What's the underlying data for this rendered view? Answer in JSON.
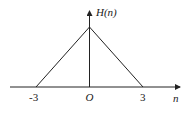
{
  "diagram": {
    "type": "triangular-function-plot",
    "y_axis_label": "H(n)",
    "x_axis_label": "n",
    "origin_label": "O",
    "ticks": [
      {
        "label": "-3",
        "value": -3
      },
      {
        "label": "3",
        "value": 3
      }
    ],
    "shape": {
      "description": "triangle peaked at n=0, zero at n=-3 and n=3",
      "points": [
        [
          -3,
          0
        ],
        [
          0,
          1
        ],
        [
          3,
          0
        ]
      ]
    },
    "line_color": "#222222"
  }
}
